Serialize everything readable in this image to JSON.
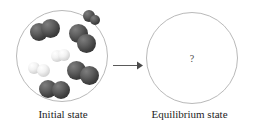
{
  "figure": {
    "arrow_icon": "right-arrow-icon",
    "unknown_symbol": "?"
  },
  "panels": {
    "initial": {
      "caption": "Initial state",
      "vessel_icon": "reaction-vessel-circle",
      "molecule_counts": {
        "dark_diatomic": 5,
        "light_diatomic": 2
      },
      "molecules": [
        {
          "id": "dark-molecule-1",
          "type": "dark",
          "atoms": [
            {
              "cx": 23,
              "cy": 22,
              "r": 9.0
            },
            {
              "cx": 34,
              "cy": 18,
              "r": 9.5
            }
          ]
        },
        {
          "id": "dark-molecule-2",
          "type": "dark",
          "atoms": [
            {
              "cx": 62,
              "cy": 23,
              "r": 9.5
            },
            {
              "cx": 70,
              "cy": 33,
              "r": 9.5
            }
          ]
        },
        {
          "id": "light-molecule-1",
          "type": "light",
          "atoms": [
            {
              "cx": 41,
              "cy": 46,
              "r": 6.0
            },
            {
              "cx": 48,
              "cy": 45,
              "r": 6.0
            }
          ]
        },
        {
          "id": "light-molecule-2",
          "type": "light",
          "atoms": [
            {
              "cx": 18,
              "cy": 58,
              "r": 6.0
            },
            {
              "cx": 27,
              "cy": 60,
              "r": 6.5
            }
          ]
        },
        {
          "id": "dark-molecule-3",
          "type": "dark",
          "atoms": [
            {
              "cx": 60,
              "cy": 60,
              "r": 9.5
            },
            {
              "cx": 73,
              "cy": 65,
              "r": 9.5
            }
          ]
        },
        {
          "id": "dark-molecule-4",
          "type": "dark",
          "atoms": [
            {
              "cx": 32,
              "cy": 79,
              "r": 9.0
            },
            {
              "cx": 45,
              "cy": 80,
              "r": 9.0
            }
          ]
        },
        {
          "id": "dark-molecule-5",
          "type": "dark",
          "atoms": [
            {
              "cx": 73,
              "cy": 6,
              "r": 6.0
            },
            {
              "cx": 79,
              "cy": 10,
              "r": 5.0
            }
          ]
        }
      ]
    },
    "equilibrium": {
      "caption": "Equilibrium state",
      "vessel_icon": "reaction-vessel-circle",
      "contents_label": "?"
    }
  },
  "colors": {
    "background": "#ffffff",
    "vessel_stroke": "#b9b9b9",
    "dark_atom": "#4a4a4a",
    "light_atom": "#e8e8e8",
    "arrow": "#5a5a5a",
    "caption_text": "#1d1d1d",
    "question_text": "#4a4a4a"
  }
}
